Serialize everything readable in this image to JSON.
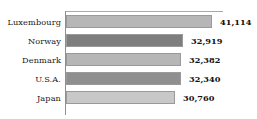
{
  "chart_data": {
    "type": "bar",
    "orientation": "horizontal",
    "title": "",
    "subtitle": "",
    "xlabel": "",
    "ylabel": "",
    "categories": [
      "Luxembourg",
      "Norway",
      "Denmark",
      "U.S.A.",
      "Japan"
    ],
    "values": [
      41114,
      32919,
      32382,
      32340,
      30760
    ],
    "value_labels": [
      "41,114",
      "32,919",
      "32,382",
      "32,340",
      "30,760"
    ],
    "xlim": [
      0,
      45000
    ],
    "grid": false,
    "legend": null,
    "bar_colors": [
      "#b6b6b6",
      "#7e7e7e",
      "#b6b6b6",
      "#8f8f8f",
      "#c8c8c8"
    ],
    "bar_border_color": "#9a9a9a",
    "axis_color": "#8e8e8e",
    "background": "#ffffff",
    "bars": [
      {
        "category": "Luxembourg",
        "value": 41114,
        "label": "41,114",
        "color": "#b6b6b6",
        "pixel_width": 146
      },
      {
        "category": "Norway",
        "value": 32919,
        "label": "32,919",
        "color": "#7e7e7e",
        "pixel_width": 117
      },
      {
        "category": "Denmark",
        "value": 32382,
        "label": "32,382",
        "color": "#b6b6b6",
        "pixel_width": 115
      },
      {
        "category": "U.S.A.",
        "value": 32340,
        "label": "32,340",
        "color": "#8f8f8f",
        "pixel_width": 115
      },
      {
        "category": "Japan",
        "value": 30760,
        "label": "30,760",
        "color": "#c8c8c8",
        "pixel_width": 109
      }
    ]
  }
}
